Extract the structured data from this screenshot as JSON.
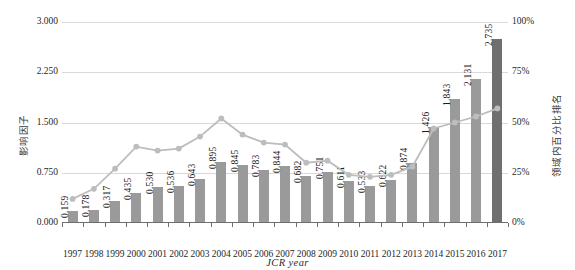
{
  "chart_data": {
    "type": "bar",
    "title": "",
    "subtitle": "",
    "xlabel": "JCR year",
    "ylabel": "影响因子",
    "y2label": "领域内百分比排名",
    "grid": true,
    "legend_position": "none",
    "categories": [
      "1997",
      "1998",
      "1999",
      "2000",
      "2001",
      "2002",
      "2003",
      "2004",
      "2005",
      "2006",
      "2007",
      "2008",
      "2009",
      "2010",
      "2011",
      "2012",
      "2013",
      "2014",
      "2015",
      "2016",
      "2017"
    ],
    "ylim": [
      0,
      3.0
    ],
    "yticks": [
      "0.000",
      "0.750",
      "1.500",
      "2.250",
      "3.000"
    ],
    "ytick_values": [
      0,
      0.75,
      1.5,
      2.25,
      3.0
    ],
    "y2lim": [
      0,
      100
    ],
    "y2ticks": [
      "0%",
      "25%",
      "50%",
      "75%",
      "100%"
    ],
    "y2tick_values": [
      0,
      25,
      50,
      75,
      100
    ],
    "series": [
      {
        "name": "影响因子",
        "type": "bar",
        "axis": "left",
        "color": "#9a9a9a",
        "highlight_color": "#6f6f6f",
        "highlight_index": 20,
        "values": [
          0.159,
          0.178,
          0.317,
          0.435,
          0.53,
          0.536,
          0.643,
          0.895,
          0.845,
          0.783,
          0.844,
          0.682,
          0.751,
          0.611,
          0.533,
          0.622,
          0.874,
          1.426,
          1.843,
          2.131,
          2.735
        ],
        "labels": [
          "0.159",
          "0.178",
          "0.317",
          "0.435",
          "0.530",
          "0.536",
          "0.643",
          "0.895",
          "0.845",
          "0.783",
          "0.844",
          "0.682",
          "0.751",
          "0.611",
          "0.533",
          "0.622",
          "0.874",
          "1.426",
          "1.843",
          "2.131",
          "2.735"
        ]
      },
      {
        "name": "领域内百分比排名",
        "type": "line",
        "axis": "right",
        "color": "#bdbdbd",
        "values": [
          12,
          17,
          27,
          38,
          36,
          37,
          43,
          52,
          44,
          40,
          39,
          30,
          31,
          24,
          23,
          24,
          28,
          47,
          50,
          53,
          57
        ]
      }
    ]
  }
}
